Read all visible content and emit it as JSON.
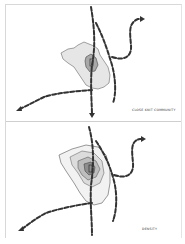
{
  "diagrams": [
    {
      "id": "top",
      "caption": "Close knit community",
      "style": "single zone with core",
      "colors": {
        "zone_fill": "#e6e6e6",
        "core_fill": "#a8a8a8",
        "path": "#333333"
      }
    },
    {
      "id": "bottom",
      "caption": "Density",
      "style": "concentric contour rings",
      "colors": {
        "ring1": "#f2f2f2",
        "ring2": "#dcdcdc",
        "ring3": "#bdbdbd",
        "ring4": "#8e8e8e",
        "path": "#333333"
      }
    }
  ],
  "icons": [
    "arrow-head-icon",
    "dashed-path-icon"
  ]
}
